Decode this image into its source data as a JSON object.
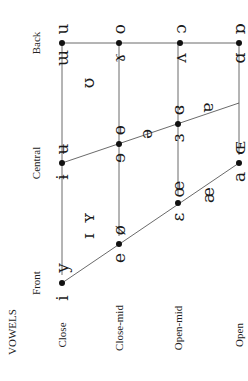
{
  "title": "VOWELS",
  "columns": [
    {
      "key": "front",
      "label": "Front",
      "x": 283
    },
    {
      "key": "central",
      "label": "Central",
      "x": 163
    },
    {
      "key": "back",
      "label": "Back",
      "x": 43
    }
  ],
  "rows": [
    {
      "key": "close",
      "label": "Close",
      "y": 62
    },
    {
      "key": "close_mid",
      "label": "Close-mid",
      "y": 119
    },
    {
      "key": "open_mid",
      "label": "Open-mid",
      "y": 178
    },
    {
      "key": "open",
      "label": "Open",
      "y": 239
    }
  ],
  "pairs": [
    {
      "row": "close",
      "col": "front",
      "unrounded": "i",
      "rounded": "y",
      "dot": [
        62,
        283
      ]
    },
    {
      "row": "close",
      "col": "central",
      "unrounded": "ɨ",
      "rounded": "ʉ",
      "dot": [
        62,
        163
      ]
    },
    {
      "row": "close",
      "col": "back",
      "unrounded": "ɯ",
      "rounded": "u",
      "dot": [
        62,
        43
      ]
    },
    {
      "row": "close_mid",
      "col": "front",
      "unrounded": "e",
      "rounded": "ø",
      "dot": [
        119,
        244
      ]
    },
    {
      "row": "close_mid",
      "col": "central",
      "unrounded": "ɘ",
      "rounded": "ɵ",
      "dot": [
        119,
        144
      ]
    },
    {
      "row": "close_mid",
      "col": "back",
      "unrounded": "ɤ",
      "rounded": "o",
      "dot": [
        119,
        43
      ]
    },
    {
      "row": "open_mid",
      "col": "front",
      "unrounded": "ɛ",
      "rounded": "œ",
      "dot": [
        178,
        203
      ]
    },
    {
      "row": "open_mid",
      "col": "central",
      "unrounded": "ɜ",
      "rounded": "ɞ",
      "dot": [
        178,
        124
      ]
    },
    {
      "row": "open_mid",
      "col": "back",
      "unrounded": "ʌ",
      "rounded": "ɔ",
      "dot": [
        180,
        43
      ]
    },
    {
      "row": "open",
      "col": "front",
      "unrounded": "a",
      "rounded": "ɶ",
      "dot": [
        239,
        163
      ]
    },
    {
      "row": "open",
      "col": "back",
      "unrounded": "ɑ",
      "rounded": "ɒ",
      "dot": [
        239,
        43
      ]
    }
  ],
  "singles": [
    {
      "symbol": "ɪ",
      "pos": [
        88,
        236
      ]
    },
    {
      "symbol": "ʏ",
      "pos": [
        88,
        218
      ]
    },
    {
      "symbol": "ʊ",
      "pos": [
        88,
        83
      ]
    },
    {
      "symbol": "ə",
      "pos": [
        146,
        134
      ]
    },
    {
      "symbol": "æ",
      "pos": [
        208,
        195
      ]
    },
    {
      "symbol": "ɐ",
      "pos": [
        207,
        108
      ]
    }
  ]
}
